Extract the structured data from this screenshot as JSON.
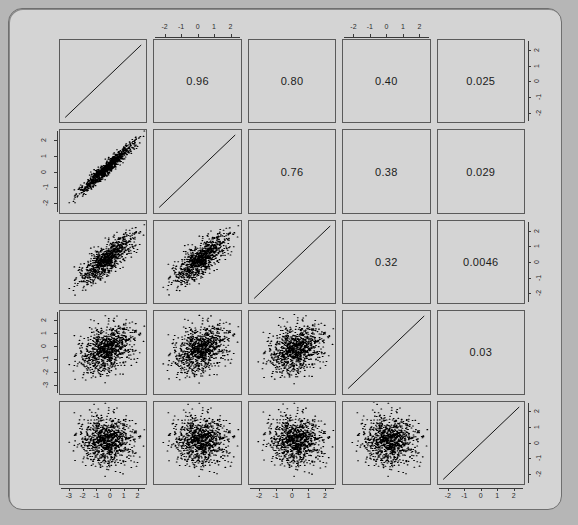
{
  "figure": {
    "kind": "scatterplot-matrix",
    "variables": [
      "V1",
      "V2",
      "V3",
      "V4",
      "V5"
    ],
    "n_vars": 5,
    "background_color": "#d4d4d4",
    "outer_background_color": "#b6b6b6",
    "border_color": "#5a5a5a",
    "point_color": "#000000",
    "line_color": "#000000"
  },
  "chart_data": {
    "type": "scatter",
    "title": "",
    "xlabel": "",
    "ylabel": "",
    "grid": false,
    "legend_position": "none",
    "layout": "5x5 pair matrix: lower triangle scatter, diagonal identity line, upper triangle correlation text",
    "variables": [
      "V1",
      "V2",
      "V3",
      "V4",
      "V5"
    ],
    "n_points_per_panel": 1000,
    "correlation_matrix": [
      [
        1.0,
        0.96,
        0.8,
        0.4,
        0.025
      ],
      [
        0.96,
        1.0,
        0.76,
        0.38,
        0.029
      ],
      [
        0.8,
        0.76,
        1.0,
        0.32,
        0.0046
      ],
      [
        0.4,
        0.38,
        0.32,
        1.0,
        0.03
      ],
      [
        0.025,
        0.029,
        0.0046,
        0.03,
        1.0
      ]
    ],
    "upper_triangle_labels": [
      {
        "row": 1,
        "col": 2,
        "value": "0.96"
      },
      {
        "row": 1,
        "col": 3,
        "value": "0.80"
      },
      {
        "row": 1,
        "col": 4,
        "value": "0.40"
      },
      {
        "row": 1,
        "col": 5,
        "value": "0.025"
      },
      {
        "row": 2,
        "col": 3,
        "value": "0.76"
      },
      {
        "row": 2,
        "col": 4,
        "value": "0.38"
      },
      {
        "row": 2,
        "col": 5,
        "value": "0.029"
      },
      {
        "row": 3,
        "col": 4,
        "value": "0.32"
      },
      {
        "row": 3,
        "col": 5,
        "value": "0.0046"
      },
      {
        "row": 4,
        "col": 5,
        "value": "0.03"
      }
    ],
    "axes": {
      "top_col2_ticks": [
        "-2",
        "-1",
        "0",
        "1",
        "2"
      ],
      "top_col4_ticks": [
        "-2",
        "-1",
        "0",
        "1",
        "2"
      ],
      "bottom_col1_ticks": [
        "-3",
        "-2",
        "-1",
        "0",
        "1",
        "2"
      ],
      "bottom_col3_ticks": [
        "-2",
        "-1",
        "0",
        "1",
        "2"
      ],
      "bottom_col5_ticks": [
        "-2",
        "-1",
        "0",
        "1",
        "2"
      ],
      "left_row2_ticks": [
        "2",
        "1",
        "0",
        "-1",
        "-2"
      ],
      "left_row4_ticks": [
        "2",
        "1",
        "0",
        "-1",
        "-2",
        "-3"
      ],
      "right_row1_ticks": [
        "2",
        "1",
        "0",
        "-1",
        "-2"
      ],
      "right_row3_ticks": [
        "2",
        "1",
        "0",
        "-1",
        "-2"
      ],
      "right_row5_ticks": [
        "2",
        "1",
        "0",
        "-1",
        "-2"
      ],
      "xlim": [
        -3.4,
        2.9
      ],
      "ylim": [
        -3.4,
        2.9
      ]
    }
  }
}
